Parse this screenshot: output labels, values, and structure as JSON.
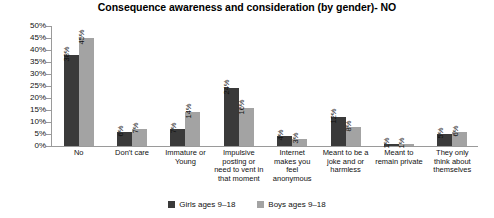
{
  "chart_data": {
    "type": "bar",
    "title": "Consequence awareness and consideration (by gender)- NO",
    "xlabel": "",
    "ylabel": "",
    "ylim": [
      0,
      50
    ],
    "ytick_labels": [
      "50%",
      "45%",
      "40%",
      "35%",
      "30%",
      "25%",
      "20%",
      "15%",
      "10%",
      "5%",
      "0%"
    ],
    "ytick_values": [
      50,
      45,
      40,
      35,
      30,
      25,
      20,
      15,
      10,
      5,
      0
    ],
    "grid": false,
    "legend_position": "bottom",
    "categories": [
      "No",
      "Don't care",
      "Immature or Young",
      "Impulsive posting or need to vent in that moment",
      "Internet makes you feel anonymous",
      "Meant to be a joke and or harmless",
      "Meant to remain private",
      "They only think about themselves"
    ],
    "series": [
      {
        "name": "Girls ages 9–18",
        "color": "#3a3a3a",
        "values": [
          38,
          6,
          7,
          24,
          4,
          12,
          1,
          5
        ],
        "labels": [
          "38%",
          "6%",
          "7%",
          "24%",
          "4%",
          "12%",
          "1%",
          "5%"
        ]
      },
      {
        "name": "Boys ages 9–18",
        "color": "#a3a3a3",
        "values": [
          45,
          7,
          14,
          16,
          3,
          8,
          1,
          6
        ],
        "labels": [
          "45%",
          "7%",
          "14%",
          "16%",
          "3%",
          "8%",
          "1%",
          "6%"
        ]
      }
    ]
  }
}
